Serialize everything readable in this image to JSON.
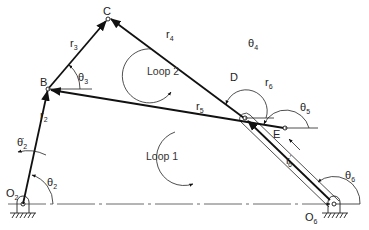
{
  "points": {
    "O2": {
      "label": "O",
      "sub": "2"
    },
    "B": {
      "label": "B"
    },
    "C": {
      "label": "C"
    },
    "D": {
      "label": "D"
    },
    "E": {
      "label": "E"
    },
    "O6": {
      "label": "O",
      "sub": "6"
    }
  },
  "vectors": {
    "r2": {
      "label": "r",
      "sub": "2"
    },
    "r3": {
      "label": "r",
      "sub": "3"
    },
    "r4": {
      "label": "r",
      "sub": "4"
    },
    "r5": {
      "label": "r",
      "sub": "5"
    },
    "r6": {
      "label": "r",
      "sub": "6"
    },
    "r6p": {
      "label": "r",
      "sub": "6",
      "prime": "′"
    }
  },
  "angles": {
    "theta2": {
      "label": "θ",
      "sub": "2"
    },
    "theta2dot": {
      "label": "θ̇",
      "sub": "2"
    },
    "theta3": {
      "label": "θ",
      "sub": "3"
    },
    "theta4": {
      "label": "θ",
      "sub": "4"
    },
    "theta5": {
      "label": "θ",
      "sub": "5"
    },
    "theta6": {
      "label": "θ",
      "sub": "6"
    }
  },
  "loops": {
    "loop1": "Loop 1",
    "loop2": "Loop 2"
  }
}
